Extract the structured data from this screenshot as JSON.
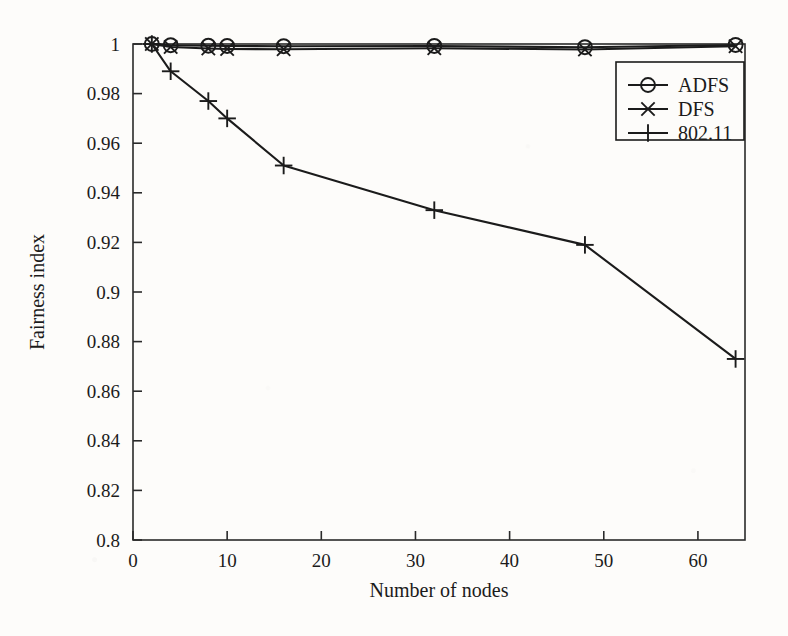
{
  "chart_data": {
    "type": "line",
    "title": "",
    "xlabel": "Number of nodes",
    "ylabel": "Fairness index",
    "xlim": [
      0,
      65
    ],
    "ylim": [
      0.8,
      1.0
    ],
    "xticks": [
      0,
      10,
      20,
      30,
      40,
      50,
      60
    ],
    "xtick_labels": [
      "0",
      "10",
      "20",
      "30",
      "40",
      "50",
      "60"
    ],
    "yticks": [
      0.8,
      0.82,
      0.84,
      0.86,
      0.88,
      0.9,
      0.92,
      0.94,
      0.96,
      0.98,
      1.0
    ],
    "ytick_labels": [
      "0.8",
      "0.82",
      "0.84",
      "0.86",
      "0.88",
      "0.9",
      "0.92",
      "0.94",
      "0.96",
      "0.98",
      "1"
    ],
    "grid": false,
    "legend_position": "upper right",
    "x": [
      2,
      4,
      8,
      10,
      16,
      32,
      48,
      64
    ],
    "series": [
      {
        "name": "ADFS",
        "marker": "circle",
        "color": "#1b1b1b",
        "values": [
          1.0,
          0.9995,
          0.9993,
          0.9992,
          0.9991,
          0.9992,
          0.9987,
          0.9996
        ]
      },
      {
        "name": "DFS",
        "marker": "x",
        "color": "#1b1b1b",
        "values": [
          1.0,
          0.9988,
          0.9982,
          0.998,
          0.9979,
          0.9983,
          0.9978,
          0.9991
        ]
      },
      {
        "name": "802.11",
        "marker": "plus",
        "color": "#1b1b1b",
        "values": [
          1.0,
          0.989,
          0.977,
          0.97,
          0.951,
          0.933,
          0.919,
          0.873
        ]
      }
    ]
  },
  "legend": {
    "entries": [
      {
        "label": "ADFS",
        "marker": "circle"
      },
      {
        "label": "DFS",
        "marker": "x"
      },
      {
        "label": "802.11",
        "marker": "plus"
      }
    ]
  },
  "axes": {
    "x_title": "Number of nodes",
    "y_title": "Fairness index"
  },
  "colors": {
    "ink": "#1b1b1b",
    "paper": "#fdfcfa",
    "axis": "#2a2a2a"
  }
}
